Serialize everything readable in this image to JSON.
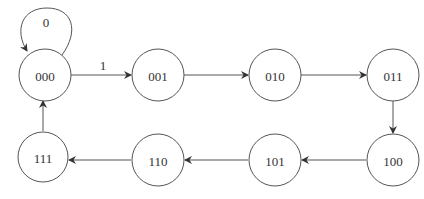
{
  "diagram": {
    "title": "",
    "states": [
      {
        "id": "s000",
        "label": "000",
        "cx": 45,
        "cy": 75
      },
      {
        "id": "s001",
        "label": "001",
        "cx": 158,
        "cy": 75
      },
      {
        "id": "s010",
        "label": "010",
        "cx": 275,
        "cy": 75
      },
      {
        "id": "s011",
        "label": "011",
        "cx": 393,
        "cy": 75
      },
      {
        "id": "s100",
        "label": "100",
        "cx": 393,
        "cy": 160
      },
      {
        "id": "s101",
        "label": "101",
        "cx": 275,
        "cy": 160
      },
      {
        "id": "s110",
        "label": "110",
        "cx": 158,
        "cy": 160
      },
      {
        "id": "s111",
        "label": "111",
        "cx": 43,
        "cy": 157
      }
    ],
    "transitions": [
      {
        "from": "000",
        "to": "000",
        "label": "0"
      },
      {
        "from": "000",
        "to": "001",
        "label": "1"
      },
      {
        "from": "001",
        "to": "010",
        "label": ""
      },
      {
        "from": "010",
        "to": "011",
        "label": ""
      },
      {
        "from": "011",
        "to": "100",
        "label": ""
      },
      {
        "from": "100",
        "to": "101",
        "label": ""
      },
      {
        "from": "101",
        "to": "110",
        "label": ""
      },
      {
        "from": "110",
        "to": "111",
        "label": ""
      },
      {
        "from": "111",
        "to": "000",
        "label": ""
      }
    ],
    "self_loop_label": "0",
    "input_label": "1"
  }
}
